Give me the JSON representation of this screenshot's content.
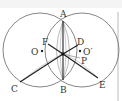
{
  "diagram": {
    "type": "geometry",
    "labels": {
      "A": "A",
      "B": "B",
      "C": "C",
      "D": "D",
      "E": "E",
      "F": "F",
      "P": "P",
      "O": "O",
      "O_prime": "O′"
    },
    "colors": {
      "stroke": "#555555",
      "bold_stroke": "#222222",
      "light_stroke": "#999999",
      "border": "#cccccc"
    }
  }
}
